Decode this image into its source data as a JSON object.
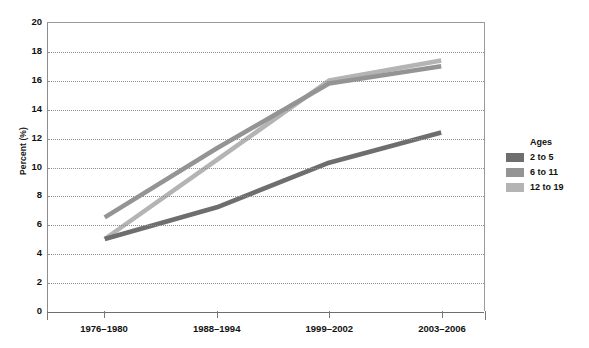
{
  "chart_data": {
    "type": "line",
    "title": "",
    "subtitle": "",
    "xlabel": "",
    "ylabel": "Percent (%)",
    "categories": [
      "1976–1980",
      "1988–1994",
      "1999–2002",
      "2003–2006"
    ],
    "ylim": [
      0,
      20
    ],
    "yticks": [
      0,
      2,
      4,
      6,
      8,
      10,
      12,
      14,
      16,
      18,
      20
    ],
    "ytick_labels": [
      "0",
      "2",
      "4",
      "6",
      "8",
      "10",
      "12",
      "14",
      "16",
      "18",
      "20"
    ],
    "grid": "horizontal-dotted",
    "legend_position": "right",
    "legend_title": "Ages",
    "series": [
      {
        "name": "2 to 5",
        "values": [
          5.0,
          7.2,
          10.3,
          12.4
        ],
        "color": "#6e6e6e"
      },
      {
        "name": "6 to 11",
        "values": [
          6.5,
          11.3,
          15.8,
          17.0
        ],
        "color": "#949494"
      },
      {
        "name": "12 to 19",
        "values": [
          5.0,
          10.5,
          16.0,
          17.4
        ],
        "color": "#b4b4b4"
      }
    ]
  },
  "axis": {
    "y_title": "Percent (%)"
  },
  "legend": {
    "title": "Ages",
    "items": [
      {
        "label": "2 to 5",
        "color": "#6e6e6e"
      },
      {
        "label": "6 to 11",
        "color": "#949494"
      },
      {
        "label": "12 to 19",
        "color": "#b4b4b4"
      }
    ]
  }
}
